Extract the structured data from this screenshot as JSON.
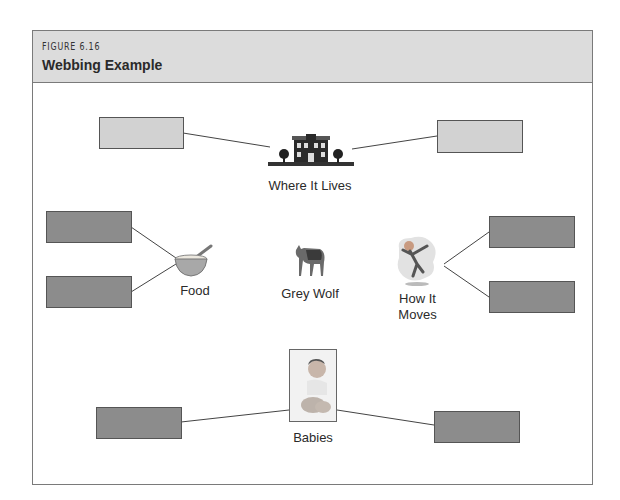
{
  "figure": {
    "number": "FIGURE 6.16",
    "title": "Webbing Example"
  },
  "center": {
    "label": "Grey Wolf",
    "icon": "wolf-icon"
  },
  "nodes": [
    {
      "id": "where",
      "label": "Where It Lives",
      "icon": "house-icon",
      "boxes": [
        "light",
        "light"
      ]
    },
    {
      "id": "food",
      "label": "Food",
      "icon": "bowl-icon",
      "boxes": [
        "dark",
        "dark"
      ]
    },
    {
      "id": "moves",
      "label_line1": "How It",
      "label_line2": "Moves",
      "icon": "running-child-icon",
      "boxes": [
        "dark",
        "dark"
      ]
    },
    {
      "id": "babies",
      "label": "Babies",
      "icon": "baby-photo-icon",
      "boxes": [
        "dark",
        "dark"
      ]
    }
  ],
  "colors": {
    "header_bg": "#dcdcdc",
    "box_light": "#d2d2d2",
    "box_dark": "#8c8c8c",
    "border": "#555555"
  }
}
